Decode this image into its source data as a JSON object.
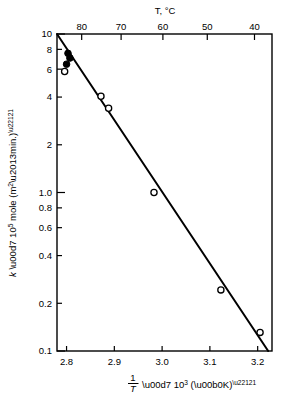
{
  "chart_data": {
    "type": "scatter",
    "title": "",
    "subtitle": "",
    "xlabel": "1/T × 10³ (°K)⁻¹",
    "ylabel": "k × 10⁵ mole (m²–min.)⁻¹",
    "top_axis_label": "T, °C",
    "yscale": "log",
    "xscale": "linear",
    "xlim": [
      2.78,
      3.23
    ],
    "ylim": [
      0.1,
      10
    ],
    "grid": false,
    "legend": "none",
    "xticks": [
      "2.8",
      "2.9",
      "3.0",
      "3.1",
      "3.2"
    ],
    "xtick_values": [
      2.8,
      2.9,
      3.0,
      3.1,
      3.2
    ],
    "yticks": [
      "10",
      "8",
      "6",
      "4",
      "2",
      "1.0",
      "0.8",
      "0.6",
      "0.4",
      "0.2",
      "0.1"
    ],
    "ytick_values": [
      10,
      8,
      6,
      4,
      2,
      1.0,
      0.8,
      0.6,
      0.4,
      0.2,
      0.1
    ],
    "top_xticks": [
      "80",
      "70",
      "60",
      "50",
      "40"
    ],
    "top_xtick_values": [
      80,
      70,
      60,
      50,
      40
    ],
    "series": [
      {
        "name": "filled-circles",
        "marker": "filled-circle",
        "color": "#000000",
        "points": [
          {
            "x": 2.803,
            "y": 7.55
          },
          {
            "x": 2.807,
            "y": 7.05
          },
          {
            "x": 2.8,
            "y": 6.45
          }
        ]
      },
      {
        "name": "open-circles",
        "marker": "open-circle",
        "color": "#000000",
        "points": [
          {
            "x": 2.796,
            "y": 5.8
          },
          {
            "x": 2.872,
            "y": 4.05
          },
          {
            "x": 2.888,
            "y": 3.4
          },
          {
            "x": 2.983,
            "y": 1.0
          },
          {
            "x": 3.123,
            "y": 0.243
          },
          {
            "x": 3.205,
            "y": 0.131
          }
        ]
      }
    ],
    "fit_line": {
      "name": "least-squares-line",
      "color": "#000000",
      "x_start": 2.78,
      "y_start": 10.0,
      "x_end": 3.222,
      "y_end": 0.1
    }
  }
}
